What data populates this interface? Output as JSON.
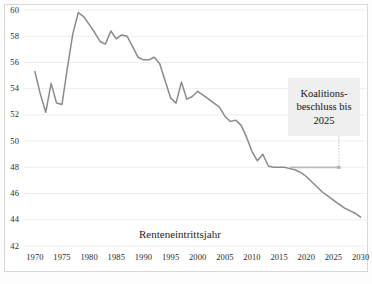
{
  "chart_data": {
    "type": "line",
    "title": "",
    "xlabel": "Renteneintrittsjahr",
    "ylabel": "",
    "xlim": [
      1968,
      2031
    ],
    "ylim": [
      42,
      60
    ],
    "grid": true,
    "legend": "none",
    "x_ticks": [
      "1970",
      "1975",
      "1980",
      "1985",
      "1990",
      "1995",
      "2000",
      "2005",
      "2010",
      "2015",
      "2020",
      "2025",
      "2030"
    ],
    "y_ticks": [
      "42",
      "44",
      "46",
      "48",
      "50",
      "52",
      "54",
      "56",
      "58",
      "60"
    ],
    "series": [
      {
        "name": "Durchschnittliches Renteneintrittsalter",
        "color": "#8a8a8a",
        "x": [
          1970,
          1971,
          1972,
          1973,
          1974,
          1975,
          1976,
          1977,
          1978,
          1979,
          1980,
          1981,
          1982,
          1983,
          1984,
          1985,
          1986,
          1987,
          1988,
          1989,
          1990,
          1991,
          1992,
          1993,
          1994,
          1995,
          1996,
          1997,
          1998,
          1999,
          2000,
          2001,
          2002,
          2003,
          2004,
          2005,
          2006,
          2007,
          2008,
          2009,
          2010,
          2011,
          2012,
          2013,
          2014,
          2015,
          2016,
          2017,
          2018,
          2019,
          2020,
          2021,
          2022,
          2023,
          2024,
          2025,
          2026,
          2027,
          2028,
          2029,
          2030
        ],
        "y": [
          55.3,
          53.6,
          52.2,
          54.4,
          52.9,
          52.8,
          55.6,
          58.2,
          59.8,
          59.5,
          58.9,
          58.3,
          57.6,
          57.4,
          58.4,
          57.8,
          58.1,
          58.0,
          57.2,
          56.4,
          56.2,
          56.2,
          56.4,
          55.9,
          54.6,
          53.3,
          52.9,
          54.5,
          53.2,
          53.4,
          53.8,
          53.5,
          53.2,
          52.9,
          52.6,
          51.9,
          51.5,
          51.6,
          51.2,
          50.3,
          49.2,
          48.5,
          49.0,
          48.1,
          48.0,
          48.0,
          48.0,
          47.9,
          47.8,
          47.6,
          47.3,
          46.9,
          46.5,
          46.1,
          45.8,
          45.5,
          45.2,
          44.9,
          44.7,
          44.5,
          44.2
        ]
      }
    ],
    "reference_line": {
      "name": "Koalitionsbeschluss-Haltelinie",
      "value": 48.0,
      "x_start": 2017,
      "x_end": 2026,
      "color": "#b9b9b9"
    },
    "annotation": {
      "lines": [
        "Koalitions-",
        "beschluss bis",
        "2025"
      ],
      "background": "#efefef",
      "target_x": 2026,
      "target_y": 48.0
    }
  },
  "colors": {
    "line": "#8a8a8a",
    "grid": "#ededed",
    "frame": "#d8d8d8",
    "text": "#1d1d1d",
    "annotation_bg": "#efefef",
    "leader": "#c4c4c4"
  }
}
